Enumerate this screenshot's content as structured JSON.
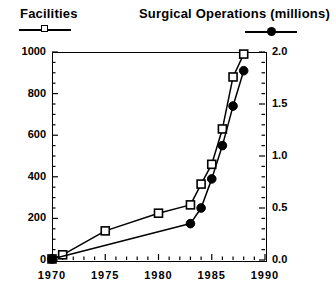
{
  "legend": {
    "facilities": {
      "title": "Facilities",
      "marker": "open-square",
      "line": "solid-black"
    },
    "operations": {
      "title": "Surgical  Operations   (millions)",
      "marker": "filled-circle",
      "line": "solid-black"
    }
  },
  "axes": {
    "x": {
      "min": 1970,
      "max": 1990,
      "tick_labels": [
        "1970",
        "1975",
        "1980",
        "1985",
        "1990"
      ],
      "tick_values": [
        1970,
        1975,
        1980,
        1985,
        1990
      ],
      "minor_tick_step": 1
    },
    "y_left": {
      "min": 0,
      "max": 1000,
      "tick_labels": [
        "0",
        "200",
        "400",
        "600",
        "800",
        "1000"
      ],
      "tick_values": [
        0,
        200,
        400,
        600,
        800,
        1000
      ],
      "minor_tick_step": 50
    },
    "y_right": {
      "min": 0.0,
      "max": 2.0,
      "tick_labels": [
        "0.0",
        "0.5",
        "1.0",
        "1.5",
        "2.0"
      ],
      "tick_values": [
        0.0,
        0.5,
        1.0,
        1.5,
        2.0
      ],
      "minor_tick_step": 0.1
    }
  },
  "caption": {
    "text": ""
  },
  "colors": {
    "ink": "#000000",
    "background": "#ffffff",
    "caption": "#7a7a7a"
  },
  "chart_data": {
    "type": "line",
    "title": "",
    "xlabel": "",
    "ylabel": "Facilities",
    "y2label": "Surgical Operations (millions)",
    "xlim": [
      1970,
      1990
    ],
    "ylim": [
      0,
      1000
    ],
    "y2lim": [
      0.0,
      2.0
    ],
    "grid": false,
    "legend_position": "above-plot",
    "series": [
      {
        "name": "Facilities",
        "axis": "left",
        "marker": "open-square",
        "x": [
          1970,
          1971,
          1975,
          1980,
          1983,
          1984,
          1985,
          1986,
          1987,
          1988
        ],
        "values": [
          5,
          25,
          140,
          225,
          265,
          365,
          460,
          630,
          880,
          990
        ]
      },
      {
        "name": "Surgical Operations (millions)",
        "axis": "right",
        "marker": "filled-circle",
        "x": [
          1970,
          1983,
          1984,
          1985,
          1986,
          1987,
          1988
        ],
        "values": [
          0.01,
          0.35,
          0.5,
          0.78,
          1.1,
          1.48,
          1.82
        ]
      }
    ]
  }
}
